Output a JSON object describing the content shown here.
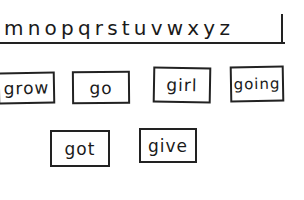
{
  "alphabet_strip": {
    "letters": "mnopqrstuvwxyz"
  },
  "word_cards": [
    {
      "word": "grow"
    },
    {
      "word": "go"
    },
    {
      "word": "girl"
    },
    {
      "word": "going"
    },
    {
      "word": "got"
    },
    {
      "word": "give"
    }
  ],
  "colors": {
    "ink": "#222222",
    "paper": "#ffffff"
  }
}
